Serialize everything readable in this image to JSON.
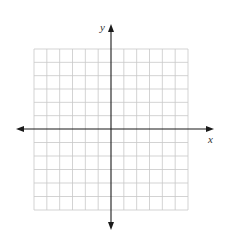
{
  "chart_data": {
    "type": "scatter",
    "title": "",
    "xlabel": "x",
    "ylabel": "y",
    "xlim": [
      -6,
      6
    ],
    "ylim": [
      -6,
      6
    ],
    "grid": true,
    "grid_step": 1,
    "x_arrows": true,
    "y_arrows": true,
    "series": [],
    "colors": {
      "grid": "#c8c8c8",
      "axis": "#1a1a1a",
      "background": "#ffffff"
    }
  }
}
